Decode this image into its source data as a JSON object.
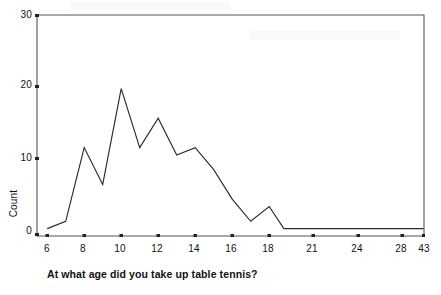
{
  "chart_data": {
    "type": "line",
    "title": "",
    "xlabel": "At what age did you take up table tennis?",
    "ylabel": "Count",
    "categories": [
      "6",
      "7",
      "8",
      "9",
      "10",
      "11",
      "12",
      "13",
      "14",
      "15",
      "16",
      "17",
      "18",
      "19",
      "20",
      "21",
      "22",
      "23",
      "24",
      "25",
      "26",
      "27",
      "28",
      "43"
    ],
    "values": [
      1,
      2,
      12,
      7,
      20,
      12,
      16,
      11,
      12,
      9,
      5,
      2,
      4,
      1,
      1,
      1,
      1,
      1,
      1,
      1,
      1,
      1,
      1,
      1
    ],
    "x_tick_labels": [
      "6",
      "8",
      "10",
      "12",
      "14",
      "16",
      "18",
      "21",
      "24",
      "28",
      "43"
    ],
    "y_tick_labels": [
      "0",
      "10",
      "20",
      "30"
    ],
    "ylim": [
      0,
      30
    ],
    "y_ticks": [
      0,
      10,
      20,
      30
    ],
    "grid": false,
    "legend": "none",
    "line_color": "#2b2b2b",
    "frame_color": "#555555",
    "background": "#ffffff",
    "axis_note": "categorical x-axis with unequal real-age spacing; ticks only on labelled categories"
  },
  "axis": {
    "y_label_text": "Count",
    "x_caption_text": "At what age did you take up table tennis?"
  }
}
